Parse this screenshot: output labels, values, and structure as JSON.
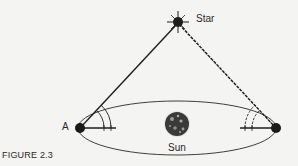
{
  "figure": {
    "caption": "FIGURE 2.3",
    "labels": {
      "star": "Star",
      "point_a": "A",
      "sun": "Sun"
    },
    "colors": {
      "ink": "#1e1e1e",
      "background": "#f4f4f2",
      "sun_fill": "#3a3a3a"
    }
  }
}
